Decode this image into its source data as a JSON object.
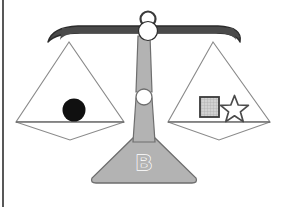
{
  "diagram": {
    "base_label": "B",
    "state": "balanced",
    "colors": {
      "beam": "#4a4a4a",
      "beam_outline": "#2b2b2b",
      "column": "#b3b3b3",
      "column_outline": "#6e6e6e",
      "base": "#b3b3b3",
      "base_outline": "#6e6e6e",
      "pan_outline": "#8a8a8a",
      "pivot_fill": "#ffffff",
      "circle_object": "#101010",
      "square_fill": "#c9c9c9",
      "square_outline": "#3a3a3a",
      "star_fill": "#ffffff",
      "star_outline": "#4a4a4a",
      "background": "#ffffff",
      "scan_edge": "#585858"
    },
    "left_pan": {
      "name": "left-pan",
      "objects": [
        {
          "shape": "circle",
          "fill": "solid-black",
          "label": ""
        }
      ]
    },
    "right_pan": {
      "name": "right-pan",
      "objects": [
        {
          "shape": "square",
          "fill": "hatched-gray",
          "label": ""
        },
        {
          "shape": "star",
          "fill": "outline-white",
          "label": ""
        }
      ]
    },
    "parts": {
      "top_ring": "top-ring",
      "beam": "beam",
      "pivot": "pivot-circle",
      "column": "column",
      "column_joint": "column-joint",
      "base": "base",
      "left_pan": "left-pan",
      "right_pan": "right-pan"
    }
  }
}
